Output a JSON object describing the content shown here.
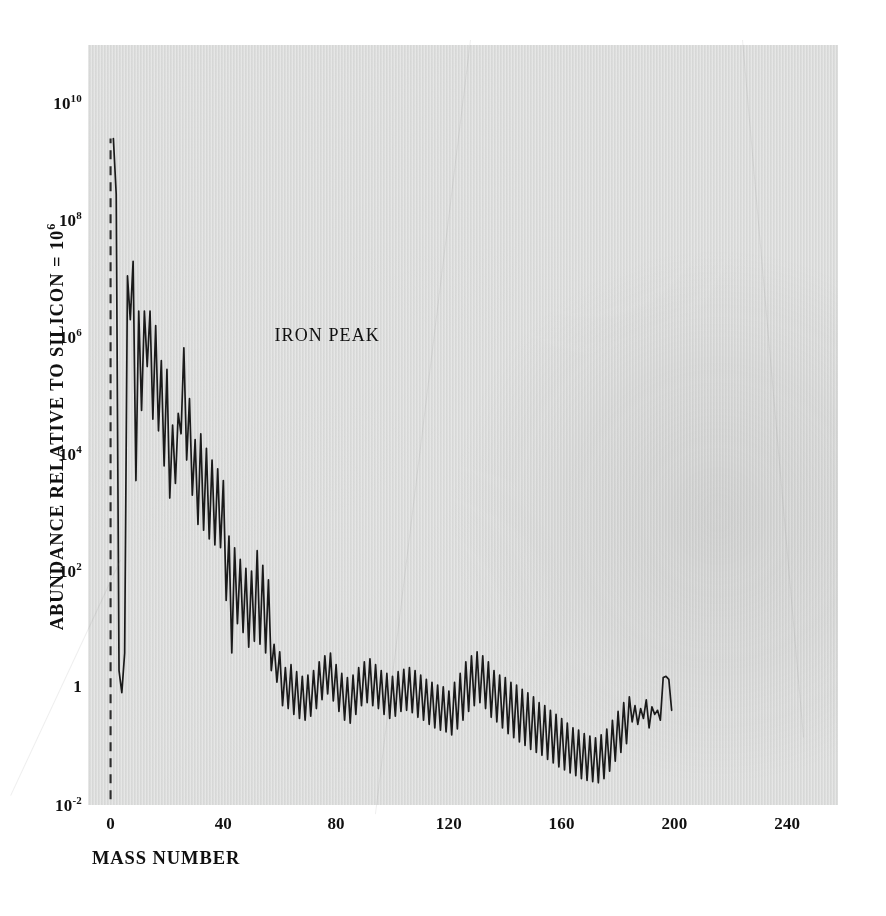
{
  "chart_data": {
    "type": "line",
    "title": "",
    "xlabel": "MASS NUMBER",
    "ylabel": "ABUNDANCE RELATIVE TO SILICON = 10",
    "ylabel_exponent": "6",
    "xlim": [
      -8,
      258
    ],
    "ylim_log10": [
      -2,
      11
    ],
    "xticks": [
      0,
      40,
      80,
      120,
      160,
      200,
      240
    ],
    "xtick_labels": [
      "0",
      "40",
      "80",
      "120",
      "160",
      "200",
      "240"
    ],
    "yticks_log10": [
      10,
      8,
      6,
      4,
      2,
      0,
      -2
    ],
    "ytick_labels": [
      "10^10",
      "10^8",
      "10^6",
      "10^4",
      "10^2",
      "1",
      "10^-2"
    ],
    "ytick_mantissa": [
      "10",
      "10",
      "10",
      "10",
      "10",
      "1",
      "10"
    ],
    "ytick_exponent": [
      "10",
      "8",
      "6",
      "4",
      "2",
      "",
      "-2"
    ],
    "grid": false,
    "legend": false,
    "line_color": "#1a1a1a",
    "background_color": "#dddedd",
    "annotations": [
      {
        "text": "IRON PEAK",
        "x": 56,
        "y_log10": 5.8
      }
    ],
    "dashed_guide": {
      "description": "vertical dashed reference line at left edge of panel",
      "x": 0,
      "y_log10_from": -1.9,
      "y_log10_to": 9.4
    },
    "series": [
      {
        "name": "Solar-system abundance",
        "x": [
          1,
          2,
          3,
          4,
          5,
          6,
          7,
          8,
          9,
          10,
          11,
          12,
          13,
          14,
          15,
          16,
          17,
          18,
          19,
          20,
          21,
          22,
          23,
          24,
          25,
          26,
          27,
          28,
          29,
          30,
          31,
          32,
          33,
          34,
          35,
          36,
          37,
          38,
          39,
          40,
          41,
          42,
          43,
          44,
          45,
          46,
          47,
          48,
          49,
          50,
          51,
          52,
          53,
          54,
          55,
          56,
          57,
          58,
          59,
          60,
          61,
          62,
          63,
          64,
          65,
          66,
          67,
          68,
          69,
          70,
          71,
          72,
          73,
          74,
          75,
          76,
          77,
          78,
          79,
          80,
          81,
          82,
          83,
          84,
          85,
          86,
          87,
          88,
          89,
          90,
          91,
          92,
          93,
          94,
          95,
          96,
          97,
          98,
          99,
          100,
          101,
          102,
          103,
          104,
          105,
          106,
          107,
          108,
          109,
          110,
          111,
          112,
          113,
          114,
          115,
          116,
          117,
          118,
          119,
          120,
          121,
          122,
          123,
          124,
          125,
          126,
          127,
          128,
          129,
          130,
          131,
          132,
          133,
          134,
          135,
          136,
          137,
          138,
          139,
          140,
          141,
          142,
          143,
          144,
          145,
          146,
          147,
          148,
          149,
          150,
          151,
          152,
          153,
          154,
          155,
          156,
          157,
          158,
          159,
          160,
          161,
          162,
          163,
          164,
          165,
          166,
          167,
          168,
          169,
          170,
          171,
          172,
          173,
          174,
          175,
          176,
          177,
          178,
          179,
          180,
          181,
          182,
          183,
          184,
          185,
          186,
          187,
          188,
          189,
          190,
          191,
          192,
          193,
          194,
          195,
          196,
          197,
          198,
          199,
          200,
          201,
          202,
          203,
          204,
          205,
          206,
          207,
          208,
          209
        ],
        "y_log10": [
          9.4,
          8.45,
          0.3,
          -0.08,
          0.6,
          7.05,
          6.3,
          7.3,
          3.55,
          6.45,
          4.75,
          6.45,
          5.5,
          6.45,
          4.6,
          6.2,
          4.4,
          5.6,
          3.8,
          5.45,
          3.25,
          4.5,
          3.5,
          4.7,
          4.35,
          5.82,
          3.9,
          4.95,
          3.3,
          4.25,
          2.8,
          4.35,
          2.7,
          4.1,
          2.55,
          3.9,
          2.45,
          3.75,
          2.4,
          3.55,
          1.5,
          2.6,
          0.6,
          2.4,
          1.1,
          2.2,
          0.95,
          2.05,
          0.7,
          2.0,
          0.8,
          2.35,
          0.75,
          2.1,
          0.6,
          1.85,
          0.3,
          0.75,
          0.1,
          0.62,
          -0.3,
          0.35,
          -0.35,
          0.4,
          -0.45,
          0.28,
          -0.52,
          0.2,
          -0.55,
          0.22,
          -0.48,
          0.3,
          -0.35,
          0.45,
          -0.2,
          0.55,
          -0.1,
          0.6,
          -0.22,
          0.4,
          -0.4,
          0.25,
          -0.55,
          0.18,
          -0.6,
          0.22,
          -0.45,
          0.35,
          -0.3,
          0.45,
          -0.25,
          0.5,
          -0.3,
          0.4,
          -0.35,
          0.3,
          -0.45,
          0.25,
          -0.52,
          0.2,
          -0.48,
          0.28,
          -0.4,
          0.32,
          -0.38,
          0.35,
          -0.42,
          0.3,
          -0.5,
          0.22,
          -0.55,
          0.15,
          -0.62,
          0.1,
          -0.68,
          0.05,
          -0.72,
          0.02,
          -0.75,
          -0.05,
          -0.8,
          0.1,
          -0.7,
          0.25,
          -0.55,
          0.45,
          -0.4,
          0.55,
          -0.3,
          0.62,
          -0.25,
          0.55,
          -0.35,
          0.45,
          -0.5,
          0.3,
          -0.58,
          0.22,
          -0.68,
          0.18,
          -0.78,
          0.1,
          -0.85,
          0.05,
          -0.92,
          -0.02,
          -0.98,
          -0.08,
          -1.05,
          -0.15,
          -1.1,
          -0.25,
          -1.15,
          -0.3,
          -1.22,
          -0.38,
          -1.28,
          -0.45,
          -1.35,
          -0.52,
          -1.4,
          -0.6,
          -1.45,
          -0.68,
          -1.5,
          -0.72,
          -1.55,
          -0.78,
          -1.58,
          -0.82,
          -1.6,
          -0.85,
          -1.62,
          -0.8,
          -1.55,
          -0.7,
          -1.42,
          -0.55,
          -1.25,
          -0.4,
          -1.1,
          -0.25,
          -0.95,
          -0.15,
          -0.58,
          -0.3,
          -0.62,
          -0.35,
          -0.52,
          -0.2,
          -0.68,
          -0.32,
          -0.45,
          -0.38,
          -0.55,
          0.18,
          0.2,
          0.15,
          -0.38
        ]
      }
    ]
  }
}
